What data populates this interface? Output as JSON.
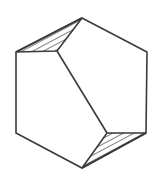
{
  "figure": {
    "type": "line-diagram",
    "canvas": {
      "width": 163,
      "height": 177,
      "background": "#ffffff"
    },
    "style": {
      "stroke_color": "#3a3a3a",
      "stroke_width": 1.6,
      "hatch_stroke_color": "#3a3a3a",
      "hatch_stroke_width": 1.1,
      "fill": "none"
    },
    "shapes": {
      "hexagon": {
        "name": "hexagon-outline",
        "points": "82,18 147,52 146,133 82,168 16,133 16,52",
        "vertex_labels": [
          "top",
          "top-right",
          "bottom-right",
          "bottom",
          "bottom-left",
          "top-left"
        ]
      },
      "diagonal": {
        "name": "interior-diagonal",
        "x1": 57,
        "y1": 51,
        "x2": 107,
        "y2": 133
      },
      "hatched_triangle_top_left": {
        "name": "hatched-triangle-top-left",
        "points": "16,52 82,18 57,51",
        "hatch_count": 15,
        "hatch_angle_deg": 62
      },
      "hatched_triangle_bottom_right": {
        "name": "hatched-triangle-bottom-right",
        "points": "82,168 146,133 107,133",
        "hatch_count": 14,
        "hatch_angle_deg": 62
      }
    }
  }
}
